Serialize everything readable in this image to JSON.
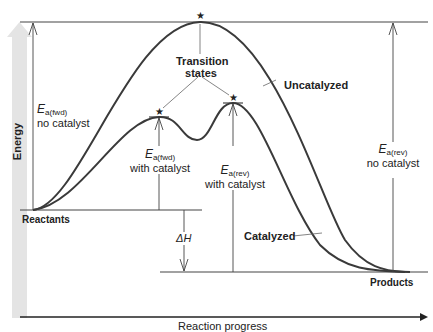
{
  "diagram": {
    "type": "reaction energy profile",
    "y_axis_label": "Energy",
    "x_axis_label": "Reaction progress",
    "colors": {
      "curve": "#3a3a3a",
      "lines": "#444444",
      "energy_arrow": "#e2e2e2",
      "text": "#222222"
    },
    "levels": {
      "reactants": "Reactants",
      "products": "Products"
    },
    "curves": {
      "uncatalyzed": "Uncatalyzed",
      "catalyzed": "Catalyzed"
    },
    "transition_states_label_line1": "Transition",
    "transition_states_label_line2": "states",
    "transition_state_marker": "★",
    "annotations": {
      "ea_fwd_no_cat": {
        "symbol": "E",
        "sub": "a(fwd)",
        "caption": "no catalyst"
      },
      "ea_fwd_cat": {
        "symbol": "E",
        "sub": "a(fwd)",
        "caption": "with catalyst"
      },
      "ea_rev_cat": {
        "symbol": "E",
        "sub": "a(rev)",
        "caption": "with catalyst"
      },
      "ea_rev_no_cat": {
        "symbol": "E",
        "sub": "a(rev)",
        "caption": "no catalyst"
      },
      "delta_h": {
        "symbol": "ΔH"
      }
    }
  }
}
